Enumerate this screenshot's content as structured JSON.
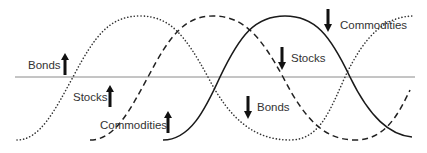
{
  "diagram": {
    "type": "phase-cycle",
    "axis": {
      "y": 77,
      "x_start": 15,
      "x_end": 415,
      "color": "#888888"
    },
    "curves": [
      {
        "name": "Bonds",
        "style": "dotted",
        "path": "M17,140 C40,140 55,110 73,77 C95,35 110,16 140,16 C170,16 185,35 208,77 C230,120 255,140 290,140 C320,140 330,110 345,77 C365,35 385,16 415,16"
      },
      {
        "name": "Stocks",
        "style": "dashed",
        "path": "M90,140 C115,140 130,110 148,77 C170,35 185,16 213,16 C243,16 260,35 283,77 C305,120 325,140 355,140 C385,140 398,115 410,90"
      },
      {
        "name": "Commodities",
        "style": "solid",
        "path": "M163,140 C190,140 205,110 220,77 C240,35 255,16 285,16 C315,16 330,35 350,77 C370,118 390,135 412,137"
      }
    ],
    "labels": [
      {
        "id": "bonds-up",
        "text": "Bonds",
        "direction": "up",
        "x": 28,
        "y": 59,
        "arrow_x": 65,
        "arrow_y": 53
      },
      {
        "id": "stocks-up",
        "text": "Stocks",
        "direction": "up",
        "x": 73,
        "y": 91,
        "arrow_x": 110,
        "arrow_y": 85
      },
      {
        "id": "commodities-up",
        "text": "Commodities",
        "direction": "up",
        "x": 100,
        "y": 118,
        "arrow_x": 168,
        "arrow_y": 111
      },
      {
        "id": "commodities-down",
        "text": "Commodities",
        "direction": "down",
        "x": 340,
        "y": 18,
        "arrow_x": 328,
        "arrow_y": 9
      },
      {
        "id": "stocks-down",
        "text": "Stocks",
        "direction": "down",
        "x": 291,
        "y": 52,
        "arrow_x": 282,
        "arrow_y": 47
      },
      {
        "id": "bonds-down",
        "text": "Bonds",
        "direction": "down",
        "x": 257,
        "y": 100,
        "arrow_x": 248,
        "arrow_y": 96
      }
    ]
  },
  "labels": {
    "bonds_up": "Bonds",
    "stocks_up": "Stocks",
    "commodities_up": "Commodities",
    "commodities_down": "Commodities",
    "stocks_down": "Stocks",
    "bonds_down": "Bonds"
  },
  "colors": {
    "line": "#1a1a1a",
    "axis": "#888888",
    "text": "#333333",
    "arrow": "#111111"
  }
}
